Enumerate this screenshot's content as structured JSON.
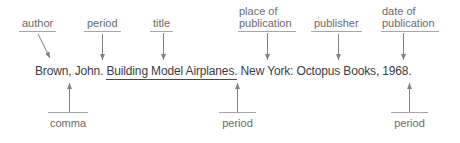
{
  "colors": {
    "background": "#ffffff",
    "label_text": "#6a6a6a",
    "guide_line": "#a6a6a6",
    "arrow": "#828282",
    "citation_text": "#3d3d3d",
    "title_underline": "#4a4a4a"
  },
  "citation": {
    "author_and_period": "Brown, John. ",
    "title": "Building Model Airplanes.",
    "rest": " New York: Octopus Books, 1968."
  },
  "top_labels": {
    "author": "author",
    "period": "period",
    "title": "title",
    "place_of_publication": "place of publication",
    "publisher": "publisher",
    "date_of_publication": "date of publication"
  },
  "bottom_labels": {
    "comma": "comma",
    "period_after_title": "period",
    "period_after_date": "period"
  }
}
